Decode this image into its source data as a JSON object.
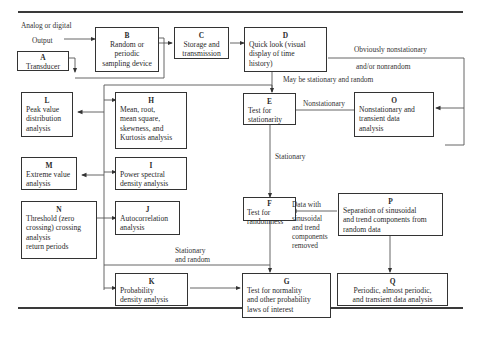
{
  "diagram": {
    "nodes": {
      "A": {
        "id": "A",
        "text": "Transducer"
      },
      "B": {
        "id": "B",
        "text": "Random or periodic\nsampling device"
      },
      "C": {
        "id": "C",
        "text": "Storage and\ntransmission"
      },
      "D": {
        "id": "D",
        "text": "Quick look (visual\ndisplay of time\nhistory)"
      },
      "E": {
        "id": "E",
        "text": "Test for\nstationarity"
      },
      "F": {
        "id": "F",
        "text": "Test for\nrandomness"
      },
      "G": {
        "id": "G",
        "text": "Test for normality\nand other probability\nlaws of interest"
      },
      "H": {
        "id": "H",
        "text": "Mean, root,\nmean square,\nskewness, and\nKurtosis analysis"
      },
      "I": {
        "id": "I",
        "text": "Power spectral\ndensity analysis"
      },
      "J": {
        "id": "J",
        "text": "Autocorrelation\nanalysis"
      },
      "K": {
        "id": "K",
        "text": "Probability\ndensity analysis"
      },
      "L": {
        "id": "L",
        "text": "Peak value\ndistribution\nanalysis"
      },
      "M": {
        "id": "M",
        "text": "Extreme value\nanalysis"
      },
      "N": {
        "id": "N",
        "text": "Threshold (zero\ncrossing) crossing\nanalysis\nreturn periods"
      },
      "O": {
        "id": "O",
        "text": "Nonstationary and\ntransient data\nanalysis"
      },
      "P": {
        "id": "P",
        "text": "Separation of sinusoidal\nand trend components from\nrandom data"
      },
      "Q": {
        "id": "Q",
        "text": "Periodic, almost periodic,\nand transient data analysis"
      }
    },
    "labels": {
      "analog_output": "Analog or digital",
      "output": "Output",
      "obviously_nonstationary": "Obviously nonstationary",
      "and_or_nonrandom": "and/or nonrandom",
      "may_be_stationary": "May be stationary and random",
      "nonstationary": "Nonstationary",
      "stationary": "Stationary",
      "data_with": "Data with",
      "sinusoidal_removed": "sinusoidal\nand trend\ncomponents\nremoved",
      "stationary_and_random": "Stationary\nand random"
    },
    "edges": [
      [
        "A",
        "B"
      ],
      [
        "B",
        "C"
      ],
      [
        "C",
        "D"
      ],
      [
        "D",
        "E"
      ],
      [
        "D",
        "O"
      ],
      [
        "D",
        "P"
      ],
      [
        "E",
        "O"
      ],
      [
        "E",
        "F"
      ],
      [
        "P",
        "F"
      ],
      [
        "P",
        "Q"
      ],
      [
        "F",
        "G"
      ],
      [
        "K",
        "G"
      ],
      [
        "bus",
        "H"
      ],
      [
        "bus",
        "I"
      ],
      [
        "bus",
        "J"
      ],
      [
        "bus",
        "K"
      ],
      [
        "bus",
        "L"
      ],
      [
        "bus",
        "M"
      ],
      [
        "N",
        "J"
      ]
    ]
  }
}
